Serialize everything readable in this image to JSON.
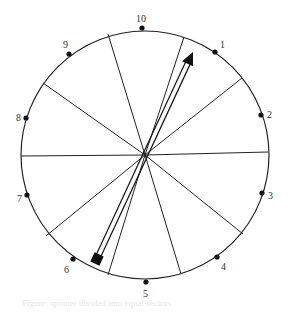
{
  "diagram": {
    "type": "circular spinner with arrow",
    "center": {
      "x": 145,
      "y": 155
    },
    "radius": 124,
    "sectors": 12,
    "points": [
      {
        "label": "1",
        "x": 215,
        "y": 52,
        "lx": 220,
        "ly": 48
      },
      {
        "label": "2",
        "x": 261,
        "y": 115,
        "lx": 267,
        "ly": 118
      },
      {
        "label": "3",
        "x": 262,
        "y": 193,
        "lx": 268,
        "ly": 199
      },
      {
        "label": "4",
        "x": 217,
        "y": 257,
        "lx": 221,
        "ly": 270
      },
      {
        "label": "5",
        "x": 146,
        "y": 282,
        "lx": 143,
        "ly": 297
      },
      {
        "label": "6",
        "x": 73,
        "y": 259,
        "lx": 64,
        "ly": 273
      },
      {
        "label": "7",
        "x": 27,
        "y": 195,
        "lx": 17,
        "ly": 202
      },
      {
        "label": "8",
        "x": 26,
        "y": 118,
        "lx": 16,
        "ly": 121
      },
      {
        "label": "9",
        "x": 69,
        "y": 54,
        "lx": 63,
        "ly": 48
      },
      {
        "label": "10",
        "x": 142,
        "y": 28,
        "lx": 136,
        "ly": 22
      }
    ],
    "arrow": {
      "tail_x": 97,
      "tail_y": 259,
      "head_x": 193,
      "head_y": 52
    },
    "caption": "Figure: spinner divided into equal sectors"
  }
}
